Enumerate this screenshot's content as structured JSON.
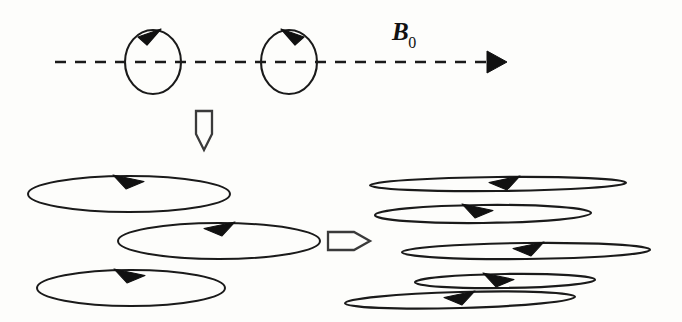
{
  "figure": {
    "background_color": "#fdfdfb",
    "stroke_color": "#1a1a1a",
    "canvas": {
      "width": 682,
      "height": 322
    }
  },
  "field_axis": {
    "label_base": "B",
    "label_subscript": "0",
    "label_x": 392,
    "label_y": 18,
    "line_y": 62,
    "line_x_start": 55,
    "line_x_end": 487,
    "dash_pattern": "11 9",
    "arrowhead_tip_x": 507,
    "arrowhead_direction": "right"
  },
  "top_circles": [
    {
      "name": "precession-circle-1",
      "cx": 153,
      "cy": 62,
      "rx": 28,
      "ry": 32,
      "arrow_direction": "right",
      "rotation_sense": "clockwise",
      "arrow_x": 153,
      "arrow_y": 30
    },
    {
      "name": "precession-circle-2",
      "cx": 289,
      "cy": 62,
      "rx": 28,
      "ry": 32,
      "arrow_direction": "left",
      "rotation_sense": "counter-clockwise",
      "arrow_x": 289,
      "arrow_y": 30
    }
  ],
  "transition_arrows": [
    {
      "name": "down-transition-arrow",
      "direction": "down",
      "x": 204,
      "y_top": 110,
      "width": 16,
      "body_height": 24,
      "tip_height": 16,
      "style": "hollow-outline"
    },
    {
      "name": "right-transition-arrow",
      "direction": "right",
      "x_left": 328,
      "y": 240,
      "body_width": 26,
      "height": 18,
      "tip_width": 16,
      "style": "hollow-outline"
    }
  ],
  "left_ellipse_group": {
    "name": "wide-cone-ellipses",
    "description": "Three broad open ellipses, moderate tilt, large precession cone angle",
    "ellipses": [
      {
        "cx": 129,
        "cy": 194,
        "rx": 101,
        "ry": 18,
        "arrow_direction": "right",
        "arrow_x": 133,
        "arrow_y": 176
      },
      {
        "cx": 219,
        "cy": 241,
        "rx": 101,
        "ry": 18,
        "arrow_direction": "left",
        "arrow_x": 215,
        "arrow_y": 223
      },
      {
        "cx": 131,
        "cy": 288,
        "rx": 94,
        "ry": 18,
        "arrow_direction": "right",
        "arrow_x": 134,
        "arrow_y": 270
      }
    ]
  },
  "right_ellipse_group": {
    "name": "narrow-cone-ellipses",
    "description": "Five flattened ellipses, small precession cone angle, alternating sense",
    "ellipses": [
      {
        "cx": 498,
        "cy": 184,
        "rx": 128,
        "ry": 7,
        "arrow_direction": "left",
        "arrow_x": 500,
        "arrow_y": 177,
        "tilt": -0.6
      },
      {
        "cx": 483,
        "cy": 214,
        "rx": 108,
        "ry": 9,
        "arrow_direction": "right",
        "arrow_x": 482,
        "arrow_y": 205,
        "tilt": -0.6
      },
      {
        "cx": 526,
        "cy": 251,
        "rx": 124,
        "ry": 8,
        "arrow_direction": "left",
        "arrow_x": 524,
        "arrow_y": 243,
        "tilt": -0.6
      },
      {
        "cx": 505,
        "cy": 281,
        "rx": 90,
        "ry": 7,
        "arrow_direction": "right",
        "arrow_x": 503,
        "arrow_y": 274,
        "tilt": -0.8
      },
      {
        "cx": 460,
        "cy": 300,
        "rx": 115,
        "ry": 8,
        "arrow_direction": "left",
        "arrow_x": 455,
        "arrow_y": 292,
        "tilt": -1.6
      }
    ]
  }
}
